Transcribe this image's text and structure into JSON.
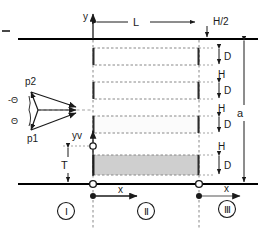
{
  "figure": {
    "kind": "schematic-cross-section"
  },
  "walls": {
    "top_label": "top-wall",
    "bottom_label": "bottom-wall",
    "color": "#000000"
  },
  "axes": {
    "y_axis": {
      "label": "y"
    },
    "yv_axis": {
      "label": "yv"
    },
    "x_axis_left": {
      "label": "x"
    },
    "x_axis_right": {
      "label": "x"
    }
  },
  "dimensions": {
    "length": {
      "label": "L"
    },
    "half_height": {
      "label": "H/2"
    },
    "aperture": {
      "label": "a"
    },
    "offset": {
      "label": "T"
    },
    "block_depth": {
      "label": "D"
    },
    "gap": {
      "label": "H"
    },
    "depth_labels": [
      "D",
      "D",
      "D",
      "D"
    ],
    "gap_labels": [
      "H",
      "H",
      "H"
    ]
  },
  "vectors": {
    "upper": {
      "label": "p2"
    },
    "lower": {
      "label": "p1"
    },
    "angle_upper": {
      "label": "-Θ"
    },
    "angle_lower": {
      "label": "Θ"
    }
  },
  "regions": [
    {
      "label": "Ⅰ",
      "name": "region-one"
    },
    {
      "label": "Ⅱ",
      "name": "region-two"
    },
    {
      "label": "Ⅲ",
      "name": "region-three"
    }
  ],
  "blocks": [
    {
      "name": "block-1",
      "shaded": false
    },
    {
      "name": "block-2",
      "shaded": false
    },
    {
      "name": "block-3",
      "shaded": false
    },
    {
      "name": "block-4",
      "shaded": true
    }
  ],
  "colors": {
    "line": "#1a1a1a",
    "wall": "#000000",
    "dashed": "#777777",
    "block_edge": "#2b2b2b",
    "shade": "#cfcfcf",
    "background": "#ffffff"
  }
}
